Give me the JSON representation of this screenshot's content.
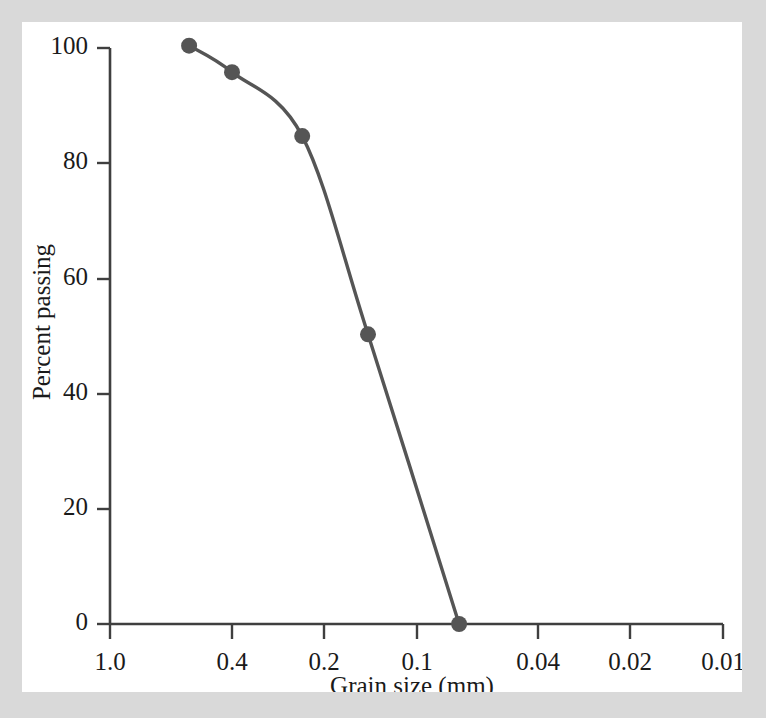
{
  "figure": {
    "background_color": "#d9d9d9",
    "panel_color": "#ffffff",
    "line_color": "#555555",
    "axis_color": "#3f3f3f",
    "text_color": "#1a1a1a"
  },
  "chart_data": {
    "type": "line",
    "title": "",
    "subtitle": "",
    "xlabel": "Grain size (mm)",
    "ylabel": "Percent passing",
    "x_scale": "log-reversed",
    "xlim": [
      1.0,
      0.01
    ],
    "ylim": [
      0,
      100
    ],
    "grid": false,
    "legend": null,
    "xticks": [
      1.0,
      0.4,
      0.2,
      0.1,
      0.04,
      0.02,
      0.01
    ],
    "xtick_labels": [
      "1.0",
      "0.4",
      "0.2",
      "0.1",
      "0.04",
      "0.02",
      "0.01"
    ],
    "yticks": [
      0,
      20,
      40,
      60,
      80,
      100
    ],
    "ytick_labels": [
      "0",
      "20",
      "40",
      "60",
      "80",
      "100"
    ],
    "series": [
      {
        "name": "Grain size distribution",
        "marker": "circle",
        "x": [
          0.552,
          0.4,
          0.236,
          0.144,
          0.0726
        ],
        "y": [
          100.4,
          95.8,
          84.7,
          50.3,
          0.0
        ]
      }
    ],
    "annotations": []
  }
}
